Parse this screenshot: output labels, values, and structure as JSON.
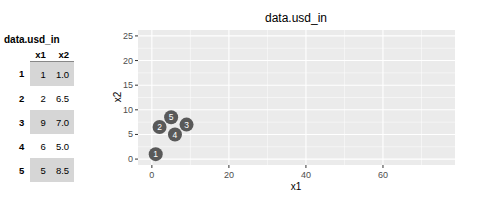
{
  "table": {
    "title": "data.usd_in",
    "columns": [
      "x1",
      "x2"
    ],
    "rows": [
      {
        "id": "1",
        "x1": "1",
        "x2": "1.0"
      },
      {
        "id": "2",
        "x1": "2",
        "x2": "6.5"
      },
      {
        "id": "3",
        "x1": "9",
        "x2": "7.0"
      },
      {
        "id": "4",
        "x1": "6",
        "x2": "5.0"
      },
      {
        "id": "5",
        "x1": "5",
        "x2": "8.5"
      }
    ]
  },
  "colors": {
    "panel_bg": "#ebebeb",
    "grid": "#ffffff",
    "point": "#595959",
    "point_label": "#ffffff",
    "shaded_row": "#d6d6d6"
  },
  "chart_data": {
    "type": "scatter",
    "title": "data.usd_in",
    "xlabel": "x1",
    "ylabel": "x2",
    "x": [
      1,
      2,
      9,
      6,
      5
    ],
    "y": [
      1.0,
      6.5,
      7.0,
      5.0,
      8.5
    ],
    "labels": [
      "1",
      "2",
      "3",
      "4",
      "5"
    ],
    "xlim": [
      -3.6,
      78.7
    ],
    "ylim": [
      -1.2,
      26.2
    ],
    "xticks": [
      0,
      20,
      40,
      60
    ],
    "yticks": [
      0,
      5,
      10,
      15,
      20,
      25
    ],
    "grid": true,
    "legend": "none"
  }
}
